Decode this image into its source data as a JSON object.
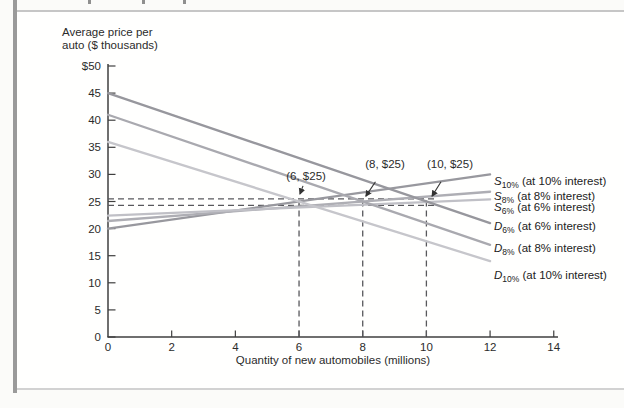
{
  "page": {
    "decoration": {
      "edge_bar_color": "#9a9a9a",
      "cropped_text_fragments_x": [
        88,
        142,
        183
      ]
    }
  },
  "chart_data": {
    "type": "line",
    "title": "",
    "ylabel_line1": "Average price per",
    "ylabel_line2": "auto ($ thousands)",
    "xlabel": "Quantity of new automobiles (millions)",
    "xlim": [
      0,
      14
    ],
    "ylim": [
      0,
      50
    ],
    "grid": false,
    "axis_color": "#3f3f3f",
    "dash_color": "#58585c",
    "annotation_color": "#333333",
    "xticks": [
      0,
      2,
      4,
      6,
      8,
      10,
      12,
      14
    ],
    "yticks": [
      0,
      5,
      10,
      15,
      20,
      25,
      30,
      35,
      40,
      45,
      50
    ],
    "ytick_labels": [
      "0",
      "5",
      "10",
      "15",
      "20",
      "25",
      "30",
      "35",
      "40",
      "45",
      "$50"
    ],
    "series": [
      {
        "id": "supply-10pct",
        "letter": "S",
        "sub": "10%",
        "desc": " (at 10% interest)",
        "color": "#98989e",
        "points": [
          [
            0,
            20.0
          ],
          [
            12,
            30.0
          ]
        ],
        "label_value": 28.6
      },
      {
        "id": "supply-8pct",
        "letter": "S",
        "sub": "8%",
        "desc": " (at 8% interest)",
        "color": "#aeaeb4",
        "points": [
          [
            0,
            21.4
          ],
          [
            12,
            26.8
          ]
        ],
        "label_value": 25.8
      },
      {
        "id": "supply-6pct",
        "letter": "S",
        "sub": "6%",
        "desc": " (at 6% interest)",
        "color": "#c0c0c6",
        "points": [
          [
            0,
            22.4
          ],
          [
            12,
            25.4
          ]
        ],
        "label_value": 23.8
      },
      {
        "id": "demand-6pct",
        "letter": "D",
        "sub": "6%",
        "desc": " (at 6% interest)",
        "color": "#97979d",
        "points": [
          [
            0,
            45.0
          ],
          [
            12,
            21.0
          ]
        ],
        "label_value": 20.3
      },
      {
        "id": "demand-8pct",
        "letter": "D",
        "sub": "8%",
        "desc": " (at 8% interest)",
        "color": "#a9a9af",
        "points": [
          [
            0,
            41.0
          ],
          [
            12,
            17.0
          ]
        ],
        "label_value": 16.2
      },
      {
        "id": "demand-10pct",
        "letter": "D",
        "sub": "10%",
        "desc": " (at 10% interest)",
        "color": "#c6c6cb",
        "points": [
          [
            0,
            36.0
          ],
          [
            12,
            14.0
          ]
        ],
        "label_value": 11.3
      }
    ],
    "equilibria": [
      {
        "quantity": 6,
        "price": 25
      },
      {
        "quantity": 8,
        "price": 25
      },
      {
        "quantity": 10,
        "price": 25
      }
    ],
    "annotations": [
      {
        "text": "(6, $25)",
        "text_x": 6.22,
        "text_y": 29.7,
        "tip_x": 6.03,
        "tip_y": 26.4
      },
      {
        "text": "(8, $25)",
        "text_x": 8.7,
        "text_y": 31.9,
        "tip_x": 8.1,
        "tip_y": 26.0
      },
      {
        "text": "(10, $25)",
        "text_x": 10.74,
        "text_y": 31.9,
        "tip_x": 10.18,
        "tip_y": 26.0
      }
    ],
    "dashed_hlines": [
      25.5,
      24.3
    ],
    "dashed_hline_end_x": 10.35,
    "dashed_vlines": [
      6,
      8,
      10
    ],
    "dashed_vline_top_y": 25.6
  }
}
